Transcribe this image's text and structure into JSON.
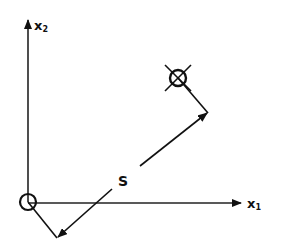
{
  "diagram": {
    "axes": {
      "x1": {
        "label": "x",
        "subscript": "1"
      },
      "x2": {
        "label": "x",
        "subscript": "2"
      }
    },
    "vector_label": "S",
    "markers": [
      {
        "name": "origin",
        "style": "circle"
      },
      {
        "name": "target",
        "style": "circle-with-cross"
      }
    ],
    "colors": {
      "ink": "#111111",
      "background": "#ffffff"
    }
  }
}
